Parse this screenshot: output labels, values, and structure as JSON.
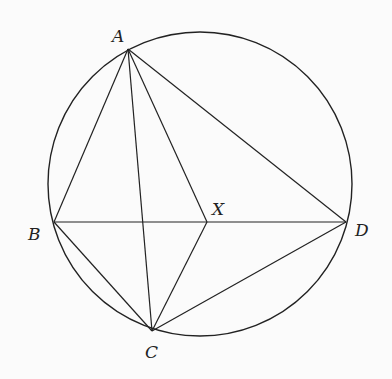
{
  "diagram": {
    "type": "geometry",
    "circle": {
      "cx": 200,
      "cy": 184,
      "r": 152
    },
    "points": {
      "A": {
        "x": 128,
        "y": 49,
        "label": "A",
        "lx": 112,
        "ly": 42
      },
      "B": {
        "x": 54,
        "y": 222,
        "label": "B",
        "lx": 28,
        "ly": 240
      },
      "C": {
        "x": 152,
        "y": 331,
        "label": "C",
        "lx": 145,
        "ly": 358
      },
      "D": {
        "x": 346,
        "y": 222,
        "label": "D",
        "lx": 355,
        "ly": 236
      },
      "X": {
        "x": 207,
        "y": 222,
        "label": "X",
        "lx": 212,
        "ly": 215
      }
    },
    "segments": [
      [
        "A",
        "B"
      ],
      [
        "A",
        "C"
      ],
      [
        "A",
        "X"
      ],
      [
        "A",
        "D"
      ],
      [
        "B",
        "D"
      ],
      [
        "B",
        "C"
      ],
      [
        "X",
        "C"
      ],
      [
        "D",
        "C"
      ]
    ],
    "colors": {
      "stroke": "#222222",
      "background": "#fbfbfb"
    }
  }
}
